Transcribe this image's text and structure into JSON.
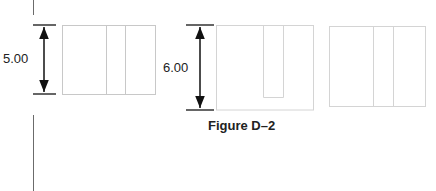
{
  "figure": {
    "caption": "Figure D–2",
    "dimensions": [
      {
        "label": "5.00",
        "target": "left-panel"
      },
      {
        "label": "6.00",
        "target": "middle-panel"
      }
    ],
    "panels": [
      {
        "name": "left-panel",
        "description": "rectangle with two vertical divisions"
      },
      {
        "name": "middle-panel",
        "description": "rectangle with U-shaped inner cutout"
      },
      {
        "name": "right-panel",
        "description": "rectangle with two vertical divisions"
      }
    ],
    "colors": {
      "outline": "#c8c8c8",
      "dimension": "#111111",
      "margin": "#6b6b6b"
    }
  }
}
